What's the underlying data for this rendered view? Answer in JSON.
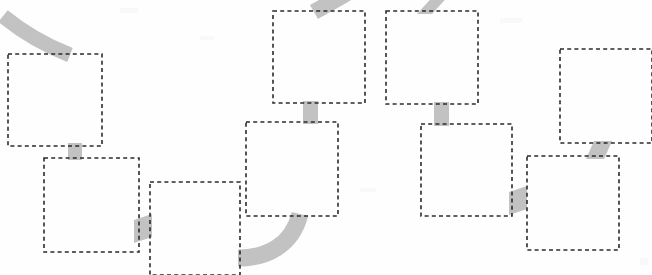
{
  "diagram": {
    "title": "Dashed box flow diagram",
    "type": "flowchart",
    "width": 652,
    "height": 275,
    "background_color": "#fefefe",
    "box_stroke_color": "#2b2b2b",
    "box_fill_color": "#ffffff",
    "connector_color": "#c2c2c2",
    "box_border_style": "dashed",
    "box_count": 9,
    "connector_count": 9,
    "nodes": [
      {
        "id": "box-1",
        "label": "",
        "x": 8,
        "y": 54,
        "w": 94,
        "h": 92,
        "row": "upper-left"
      },
      {
        "id": "box-2",
        "label": "",
        "x": 44,
        "y": 158,
        "w": 95,
        "h": 94,
        "row": "lower-left"
      },
      {
        "id": "box-3",
        "label": "",
        "x": 150,
        "y": 182,
        "w": 90,
        "h": 93,
        "row": "bottom-left"
      },
      {
        "id": "box-4",
        "label": "",
        "x": 273,
        "y": 11,
        "w": 92,
        "h": 92,
        "row": "top-middle"
      },
      {
        "id": "box-5",
        "label": "",
        "x": 386,
        "y": 11,
        "w": 92,
        "h": 93,
        "row": "top-middle-right"
      },
      {
        "id": "box-6",
        "label": "",
        "x": 246,
        "y": 122,
        "w": 92,
        "h": 94,
        "row": "middle"
      },
      {
        "id": "box-7",
        "label": "",
        "x": 421,
        "y": 124,
        "w": 91,
        "h": 92,
        "row": "middle-right"
      },
      {
        "id": "box-8",
        "label": "",
        "x": 560,
        "y": 49,
        "w": 92,
        "h": 94,
        "row": "upper-right"
      },
      {
        "id": "box-9",
        "label": "",
        "x": 527,
        "y": 156,
        "w": 92,
        "h": 94,
        "row": "lower-right"
      }
    ],
    "connectors": [
      {
        "id": "connector-1",
        "shape": "curve",
        "from": "offscreen-top-left",
        "to": "box-1",
        "side": "top"
      },
      {
        "id": "connector-2",
        "shape": "straight",
        "from": "box-1",
        "to": "box-2",
        "side": "bottom"
      },
      {
        "id": "connector-3",
        "shape": "slanted",
        "from": "box-2",
        "to": "box-3",
        "side": "right"
      },
      {
        "id": "connector-4",
        "shape": "curve",
        "from": "offscreen-top",
        "to": "box-4",
        "side": "top"
      },
      {
        "id": "connector-5",
        "shape": "straight",
        "from": "box-4",
        "to": "box-6",
        "side": "bottom"
      },
      {
        "id": "connector-6",
        "shape": "slanted",
        "from": "offscreen-top",
        "to": "box-5",
        "side": "top"
      },
      {
        "id": "connector-7",
        "shape": "straight",
        "from": "box-5",
        "to": "box-7",
        "side": "bottom"
      },
      {
        "id": "connector-8",
        "shape": "curve",
        "from": "box-6",
        "to": "box-3",
        "side": "bottom-left"
      },
      {
        "id": "connector-9",
        "shape": "slanted",
        "from": "box-7",
        "to": "box-9",
        "side": "right"
      },
      {
        "id": "connector-10",
        "shape": "slanted",
        "from": "box-8",
        "to": "box-9",
        "side": "bottom"
      }
    ]
  }
}
